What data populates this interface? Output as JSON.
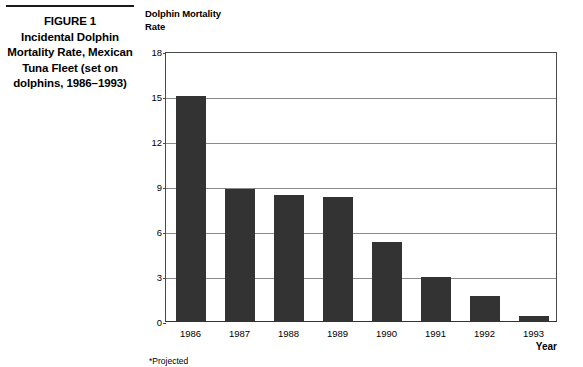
{
  "figure": {
    "caption_lines": [
      "FIGURE 1",
      "Incidental Dolphin",
      "Mortality Rate, Mexican",
      "Tuna Fleet (set on",
      "dolphins, 1986–1993)"
    ],
    "footnote": "*Projected"
  },
  "chart_data": {
    "type": "bar",
    "title": "",
    "ylabel": "Dolphin Mortality\nRate",
    "ylabel_lines": [
      "Dolphin Mortality",
      "Rate"
    ],
    "xlabel": "Year",
    "categories": [
      "1986",
      "1987",
      "1988",
      "1989",
      "1990",
      "1991",
      "1992",
      "1993"
    ],
    "values": [
      15.0,
      8.8,
      8.4,
      8.25,
      5.3,
      2.95,
      1.7,
      0.35
    ],
    "yticks": [
      0,
      3,
      6,
      9,
      12,
      15,
      18
    ],
    "ytick_labels": [
      "0",
      "3",
      "6",
      "9",
      "12",
      "15",
      "18"
    ],
    "ylim": [
      0,
      18
    ],
    "grid": true,
    "grid_axis": "y",
    "legend": false,
    "bar_color": "#333333",
    "grid_color": "#8a8a8a",
    "frame_color": "#4a4a4a"
  }
}
